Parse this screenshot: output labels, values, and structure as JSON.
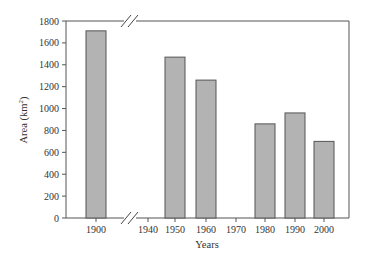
{
  "chart_data": {
    "type": "bar",
    "title": "",
    "xlabel": "Years",
    "ylabel": "Area (km²)",
    "ylabel_main": "Area (km",
    "ylabel_sup": "2",
    "ylabel_end": ")",
    "ylim": [
      0,
      1800
    ],
    "yticks": [
      0,
      200,
      400,
      600,
      800,
      1000,
      1200,
      1400,
      1600,
      1800
    ],
    "xticks": [
      "1900",
      "1940",
      "1950",
      "1960",
      "1970",
      "1980",
      "1990",
      "2000"
    ],
    "axis_break": "between 1900 and 1940",
    "grid": false,
    "legend": "none",
    "categories": [
      "1900",
      "1950",
      "1960",
      "1980",
      "1990",
      "2000"
    ],
    "values": [
      1710,
      1470,
      1260,
      860,
      960,
      700
    ],
    "bar_color": "#b3b3b3",
    "edge_color": "#555555"
  }
}
